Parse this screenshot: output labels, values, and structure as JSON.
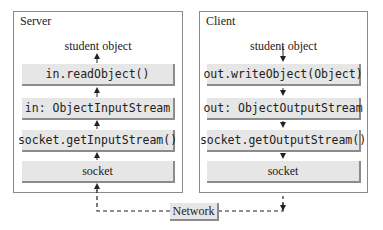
{
  "server": {
    "title": "Server",
    "caption": "student object",
    "boxes": [
      {
        "label": "in.readObject()"
      },
      {
        "label": "in: ObjectInputStream"
      },
      {
        "label": "socket.getInputStream()"
      },
      {
        "label": "socket"
      }
    ],
    "flow_direction": "up"
  },
  "client": {
    "title": "Client",
    "caption": "student object",
    "boxes": [
      {
        "label": "out.writeObject(Object)"
      },
      {
        "label": "out: ObjectOutputStream"
      },
      {
        "label": "socket.getOutputStream()"
      },
      {
        "label": "socket"
      }
    ],
    "flow_direction": "down"
  },
  "network": {
    "label": "Network"
  },
  "colors": {
    "box_fill": "#e6e6e6",
    "box_shadow": "#8c8c8c",
    "panel_border": "#8a8a8a",
    "line": "#222222"
  }
}
